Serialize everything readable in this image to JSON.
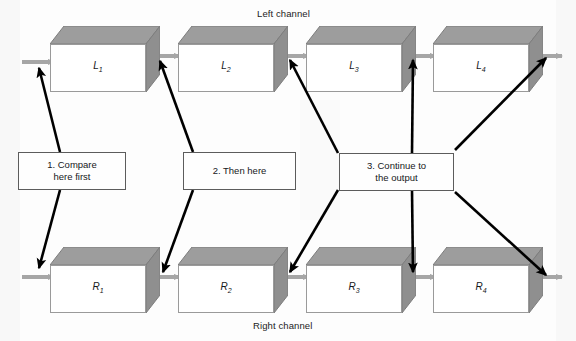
{
  "diagram": {
    "top_channel_label": "Left channel",
    "bottom_channel_label": "Right channel",
    "colors": {
      "box_top_face": "#9d9d9d",
      "box_side_face": "#8f8f8f",
      "box_front_face": "#ffffff",
      "box_outline": "#9a9a9a",
      "flow_arrow": "#a6a6a6",
      "callout_arrow": "#000000",
      "callout_border": "#5c5c5c",
      "text": "#16181a",
      "background": "#fdfdfd"
    },
    "top_row": {
      "name": "left-channel-row",
      "stages": [
        {
          "id": "L1",
          "letter": "L",
          "subscript": "1",
          "label": "L1"
        },
        {
          "id": "L2",
          "letter": "L",
          "subscript": "2",
          "label": "L2"
        },
        {
          "id": "L3",
          "letter": "L",
          "subscript": "3",
          "label": "L3"
        },
        {
          "id": "L4",
          "letter": "L",
          "subscript": "4",
          "label": "L4"
        }
      ]
    },
    "bottom_row": {
      "name": "right-channel-row",
      "stages": [
        {
          "id": "R1",
          "letter": "R",
          "subscript": "1",
          "label": "R1"
        },
        {
          "id": "R2",
          "letter": "R",
          "subscript": "2",
          "label": "R2"
        },
        {
          "id": "R3",
          "letter": "R",
          "subscript": "3",
          "label": "R3"
        },
        {
          "id": "R4",
          "letter": "R",
          "subscript": "4",
          "label": "R4"
        }
      ]
    },
    "callouts": [
      {
        "id": "callout-1",
        "line1": "1. Compare",
        "line2": "here first",
        "text": "1. Compare here first",
        "targets": [
          "L1-input",
          "R1-input"
        ]
      },
      {
        "id": "callout-2",
        "line1": "2. Then here",
        "line2": "",
        "text": "2. Then here",
        "targets": [
          "L1-L2-link",
          "R1-R2-link"
        ]
      },
      {
        "id": "callout-3",
        "line1": "3. Continue to",
        "line2": "the output",
        "text": "3. Continue to the output",
        "targets": [
          "L2-L3-link",
          "L3-L4-link",
          "L4-output",
          "R2-R3-link",
          "R3-R4-link",
          "R4-output"
        ]
      }
    ]
  }
}
